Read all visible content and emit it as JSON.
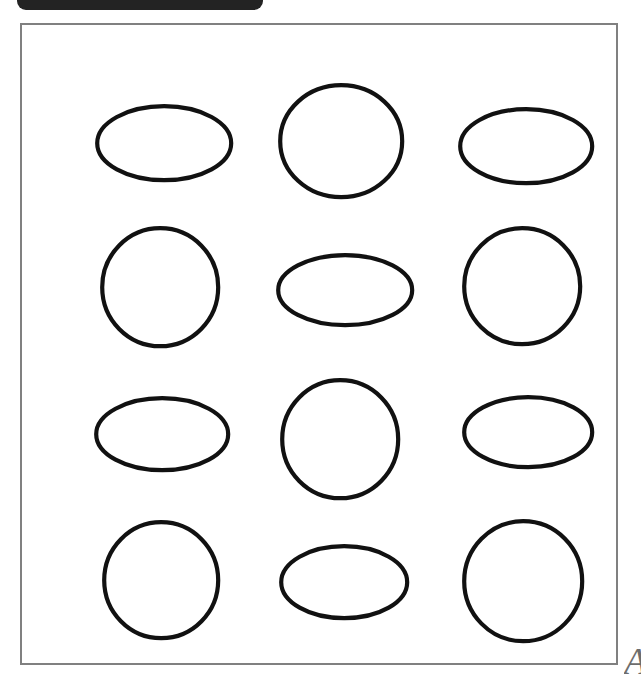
{
  "page": {
    "background_color": "#ffffff",
    "width": 641,
    "height": 681
  },
  "top_tab": {
    "name": "header-tab",
    "color": "#232323",
    "label": "",
    "note": "cut off at top edge"
  },
  "frame": {
    "border_color": "#808080",
    "border_width": 2,
    "fill_color": "#ffffff"
  },
  "corner_mark": {
    "glyph": "A",
    "color": "#6d6d6d"
  },
  "shapes": {
    "stroke_color": "#111111",
    "fill_color": "#ffffff",
    "stroke_width": 4.2,
    "rows": 4,
    "columns": 3,
    "items": [
      {
        "row": 1,
        "col": 1,
        "type": "ellipse",
        "cx": 142,
        "cy": 118,
        "rx": 67,
        "ry": 37
      },
      {
        "row": 1,
        "col": 2,
        "type": "circle",
        "cx": 319,
        "cy": 116,
        "rx": 61,
        "ry": 56
      },
      {
        "row": 1,
        "col": 3,
        "type": "ellipse",
        "cx": 504,
        "cy": 121,
        "rx": 66,
        "ry": 37
      },
      {
        "row": 2,
        "col": 1,
        "type": "circle",
        "cx": 138,
        "cy": 262,
        "rx": 58,
        "ry": 59
      },
      {
        "row": 2,
        "col": 2,
        "type": "ellipse",
        "cx": 323,
        "cy": 265,
        "rx": 67,
        "ry": 35
      },
      {
        "row": 2,
        "col": 3,
        "type": "circle",
        "cx": 500,
        "cy": 261,
        "rx": 58,
        "ry": 58
      },
      {
        "row": 3,
        "col": 1,
        "type": "ellipse",
        "cx": 140,
        "cy": 409,
        "rx": 66,
        "ry": 36
      },
      {
        "row": 3,
        "col": 2,
        "type": "circle",
        "cx": 318,
        "cy": 414,
        "rx": 58,
        "ry": 59
      },
      {
        "row": 3,
        "col": 3,
        "type": "ellipse",
        "cx": 506,
        "cy": 407,
        "rx": 64,
        "ry": 35
      },
      {
        "row": 4,
        "col": 1,
        "type": "circle",
        "cx": 139,
        "cy": 555,
        "rx": 57,
        "ry": 58
      },
      {
        "row": 4,
        "col": 2,
        "type": "ellipse",
        "cx": 322,
        "cy": 557,
        "rx": 63,
        "ry": 36
      },
      {
        "row": 4,
        "col": 3,
        "type": "circle",
        "cx": 501,
        "cy": 556,
        "rx": 59,
        "ry": 60
      }
    ]
  }
}
